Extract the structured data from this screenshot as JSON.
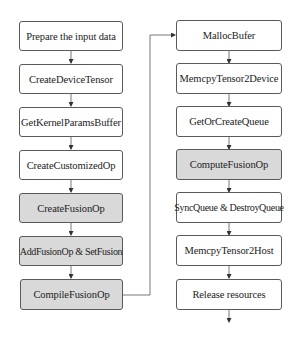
{
  "diagram": {
    "type": "flowchart",
    "colors": {
      "border": "#5a5a5a",
      "plain_fill": "#ffffff",
      "highlight_fill": "#d9d9d9",
      "text": "#222222",
      "line": "#555555"
    },
    "left_column": [
      {
        "id": "prepare-input-data",
        "label": "Prepare the input data",
        "shaded": false
      },
      {
        "id": "create-device-tensor",
        "label": "CreateDeviceTensor",
        "shaded": false
      },
      {
        "id": "get-kernel-params-buffer",
        "label": "GetKernelParamsBuffer",
        "shaded": false
      },
      {
        "id": "create-customized-op",
        "label": "CreateCustomizedOp",
        "shaded": false
      },
      {
        "id": "create-fusion-op",
        "label": "CreateFusionOp",
        "shaded": true
      },
      {
        "id": "add-fusion-op-set-fusion",
        "label": "AddFusionOp & SetFusion",
        "shaded": true
      },
      {
        "id": "compile-fusion-op",
        "label": "CompileFusionOp",
        "shaded": true
      }
    ],
    "right_column": [
      {
        "id": "malloc-bufer",
        "label": "MallocBufer",
        "shaded": false
      },
      {
        "id": "memcpy-tensor2device",
        "label": "MemcpyTensor2Device",
        "shaded": false
      },
      {
        "id": "get-or-create-queue",
        "label": "GetOrCreateQueue",
        "shaded": false
      },
      {
        "id": "compute-fusion-op",
        "label": "ComputeFusionOp",
        "shaded": true
      },
      {
        "id": "sync-destroy-queue",
        "label": "SyncQueue & DestroyQueue",
        "shaded": false
      },
      {
        "id": "memcpy-tensor2host",
        "label": "MemcpyTensor2Host",
        "shaded": false
      },
      {
        "id": "release-resources",
        "label": "Release resources",
        "shaded": false
      }
    ],
    "edges": [
      {
        "from": "prepare-input-data",
        "to": "create-device-tensor"
      },
      {
        "from": "create-device-tensor",
        "to": "get-kernel-params-buffer"
      },
      {
        "from": "get-kernel-params-buffer",
        "to": "create-customized-op"
      },
      {
        "from": "create-customized-op",
        "to": "create-fusion-op"
      },
      {
        "from": "create-fusion-op",
        "to": "add-fusion-op-set-fusion"
      },
      {
        "from": "add-fusion-op-set-fusion",
        "to": "compile-fusion-op"
      },
      {
        "from": "compile-fusion-op",
        "to": "malloc-bufer"
      },
      {
        "from": "malloc-bufer",
        "to": "memcpy-tensor2device"
      },
      {
        "from": "memcpy-tensor2device",
        "to": "get-or-create-queue"
      },
      {
        "from": "get-or-create-queue",
        "to": "compute-fusion-op"
      },
      {
        "from": "compute-fusion-op",
        "to": "sync-destroy-queue"
      },
      {
        "from": "sync-destroy-queue",
        "to": "memcpy-tensor2host"
      },
      {
        "from": "memcpy-tensor2host",
        "to": "release-resources"
      },
      {
        "from": "release-resources",
        "to": "end"
      }
    ]
  }
}
